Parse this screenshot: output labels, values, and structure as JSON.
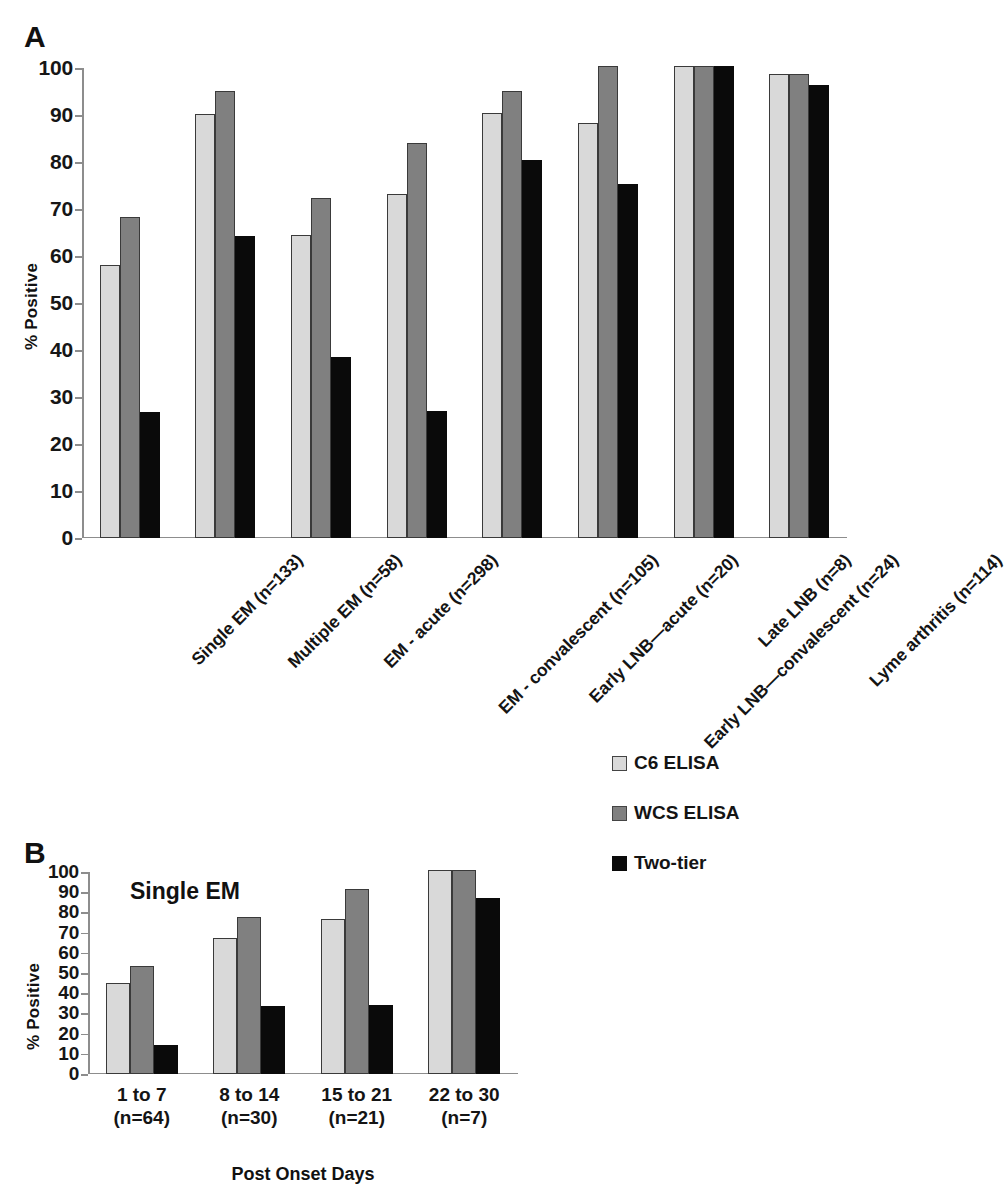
{
  "figure": {
    "panel_a_letter": "A",
    "panel_b_letter": "B"
  },
  "legend": {
    "items": [
      {
        "label": "C6 ELISA",
        "color": "#d9d9d9",
        "icon": "legend-swatch"
      },
      {
        "label": "WCS ELISA",
        "color": "#808080",
        "icon": "legend-swatch"
      },
      {
        "label": "Two-tier",
        "color": "#0a0a0a",
        "icon": "legend-swatch"
      }
    ]
  },
  "chart_data": [
    {
      "id": "panel-a",
      "type": "bar",
      "title": "",
      "xlabel": "",
      "ylabel": "% Positive",
      "ylim": [
        0,
        100
      ],
      "yticks": [
        0,
        10,
        20,
        30,
        40,
        50,
        60,
        70,
        80,
        90,
        100
      ],
      "grid": false,
      "legend_position": "right",
      "categories": [
        "Single EM (n=133)",
        "Multiple EM (n=58)",
        "EM - acute (n=298)",
        "EM - convalescent (n=105)",
        "Early LNB—acute (n=20)",
        "Early LNB—convalescent (n=24)",
        "Late LNB (n=8)",
        "Lyme arthritis (n=114)"
      ],
      "series": [
        {
          "name": "C6 ELISA",
          "color": "#d9d9d9",
          "values": [
            58,
            90.3,
            64.4,
            73.3,
            90.5,
            88.4,
            100.5,
            98.8
          ]
        },
        {
          "name": "WCS ELISA",
          "color": "#808080",
          "values": [
            68.2,
            95.2,
            72.3,
            84.1,
            95.2,
            100.5,
            100.5,
            98.8
          ]
        },
        {
          "name": "Two-tier",
          "color": "#0a0a0a",
          "values": [
            26.8,
            64.3,
            38.5,
            27,
            80.4,
            75.4,
            100.5,
            96.4
          ]
        }
      ]
    },
    {
      "id": "panel-b",
      "type": "bar",
      "title": "Single EM",
      "xlabel": "Post Onset Days",
      "ylabel": "% Positive",
      "ylim": [
        0,
        100
      ],
      "yticks": [
        0,
        10,
        20,
        30,
        40,
        50,
        60,
        70,
        80,
        90,
        100
      ],
      "grid": false,
      "legend_position": "right",
      "categories": [
        {
          "line1": "1 to 7",
          "line2": "(n=64)"
        },
        {
          "line1": "8 to 14",
          "line2": "(n=30)"
        },
        {
          "line1": "15 to 21",
          "line2": "(n=21)"
        },
        {
          "line1": "22 to 30",
          "line2": "(n=7)"
        }
      ],
      "series": [
        {
          "name": "C6 ELISA",
          "color": "#d9d9d9",
          "values": [
            45.3,
            67.5,
            76.5,
            101
          ]
        },
        {
          "name": "WCS ELISA",
          "color": "#808080",
          "values": [
            53.5,
            77.5,
            91.5,
            101
          ]
        },
        {
          "name": "Two-tier",
          "color": "#0a0a0a",
          "values": [
            14.3,
            33.8,
            34,
            87
          ]
        }
      ]
    }
  ]
}
